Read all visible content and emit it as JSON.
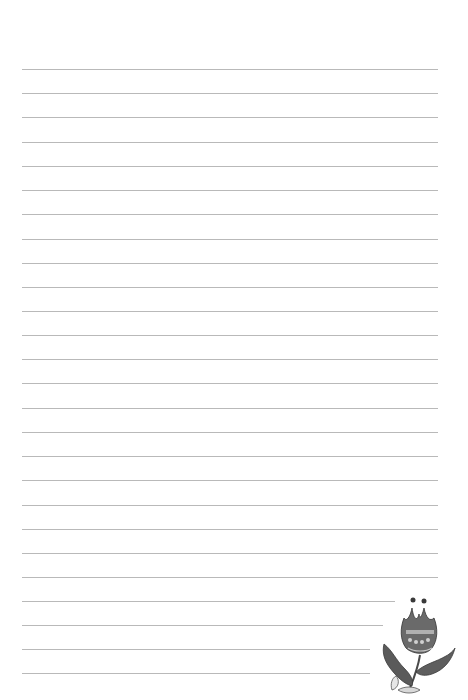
{
  "page": {
    "type": "lined-writing-paper",
    "background_color": "#ffffff",
    "line_color": "#b9b9b9",
    "line_count": 26,
    "lines": [
      {
        "y": 69,
        "x1": 22,
        "x2": 438
      },
      {
        "y": 93,
        "x1": 22,
        "x2": 438
      },
      {
        "y": 117,
        "x1": 22,
        "x2": 438
      },
      {
        "y": 142,
        "x1": 22,
        "x2": 438
      },
      {
        "y": 166,
        "x1": 22,
        "x2": 438
      },
      {
        "y": 190,
        "x1": 22,
        "x2": 438
      },
      {
        "y": 214,
        "x1": 22,
        "x2": 438
      },
      {
        "y": 239,
        "x1": 22,
        "x2": 438
      },
      {
        "y": 263,
        "x1": 22,
        "x2": 438
      },
      {
        "y": 287,
        "x1": 22,
        "x2": 438
      },
      {
        "y": 311,
        "x1": 22,
        "x2": 438
      },
      {
        "y": 335,
        "x1": 22,
        "x2": 438
      },
      {
        "y": 359,
        "x1": 22,
        "x2": 438
      },
      {
        "y": 383,
        "x1": 22,
        "x2": 438
      },
      {
        "y": 408,
        "x1": 22,
        "x2": 438
      },
      {
        "y": 432,
        "x1": 22,
        "x2": 438
      },
      {
        "y": 456,
        "x1": 22,
        "x2": 438
      },
      {
        "y": 480,
        "x1": 22,
        "x2": 438
      },
      {
        "y": 505,
        "x1": 22,
        "x2": 438
      },
      {
        "y": 529,
        "x1": 22,
        "x2": 438
      },
      {
        "y": 553,
        "x1": 22,
        "x2": 438
      },
      {
        "y": 577,
        "x1": 22,
        "x2": 438
      },
      {
        "y": 601,
        "x1": 22,
        "x2": 395
      },
      {
        "y": 625,
        "x1": 22,
        "x2": 383
      },
      {
        "y": 649,
        "x1": 22,
        "x2": 370
      },
      {
        "y": 673,
        "x1": 22,
        "x2": 370
      }
    ]
  },
  "ornament": {
    "icon": "tulip-flower-icon",
    "description": "decorative folk-art tulip with leaves",
    "color": "#4a4a4a"
  }
}
